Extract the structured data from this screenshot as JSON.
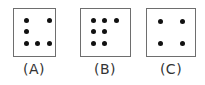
{
  "figures": [
    {
      "label": "(A)",
      "box": {
        "left": 13,
        "width": 43
      },
      "dots": [
        [
          26,
          20
        ],
        [
          49,
          20
        ],
        [
          26,
          31
        ],
        [
          26,
          43
        ],
        [
          37,
          43
        ],
        [
          49,
          43
        ]
      ]
    },
    {
      "label": "(B)",
      "box": {
        "left": 80,
        "width": 51
      },
      "dots": [
        [
          93,
          20
        ],
        [
          104,
          20
        ],
        [
          116,
          20
        ],
        [
          93,
          31
        ],
        [
          104,
          31
        ],
        [
          93,
          43
        ],
        [
          104,
          43
        ]
      ]
    },
    {
      "label": "(C)",
      "box": {
        "left": 146,
        "width": 50
      },
      "dots": [
        [
          160,
          21
        ],
        [
          182,
          21
        ],
        [
          160,
          43
        ],
        [
          182,
          43
        ]
      ]
    }
  ],
  "colors": {
    "border": "#6e6e6e",
    "dot": "#111111",
    "label": "#333333"
  }
}
